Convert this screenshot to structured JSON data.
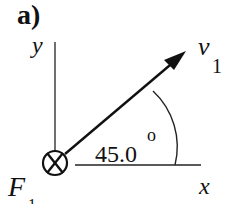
{
  "figure": {
    "panel_label": "a)",
    "axes": {
      "y_label": "y",
      "x_label": "x"
    },
    "vector": {
      "symbol": "v",
      "subscript": "1"
    },
    "angle": {
      "value": "45.0",
      "unit_symbol": "o"
    },
    "force": {
      "symbol": "F",
      "subscript": "1",
      "direction": "into page"
    },
    "colors": {
      "ink": "#111111",
      "background": "#ffffff"
    }
  }
}
